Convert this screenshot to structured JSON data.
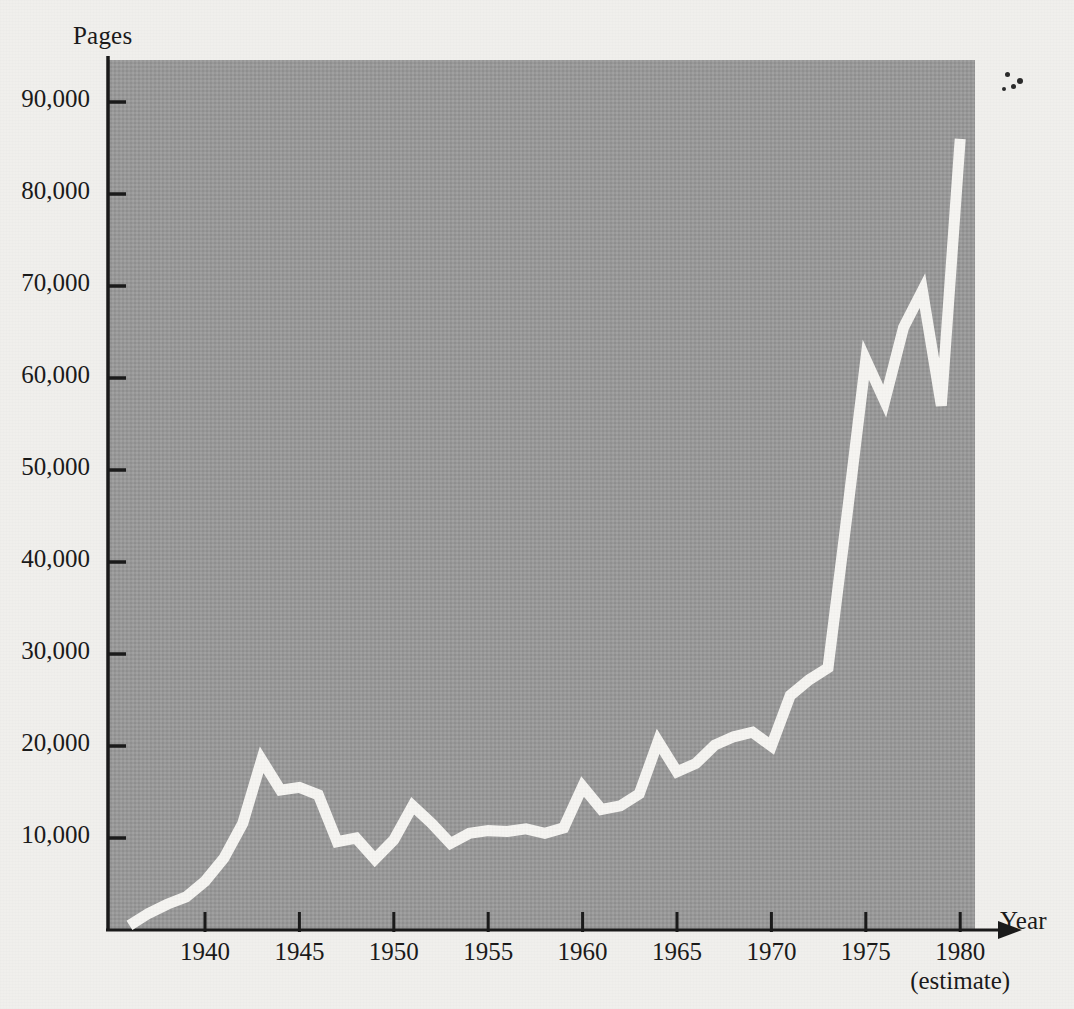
{
  "figure": {
    "y_axis_title": "Pages",
    "x_axis_title": "Year",
    "x_axis_subnote": "(estimate)",
    "plot_fill_color": "#9a9a9a",
    "line_color": "#f7f6f3",
    "axis_color": "#1a1a1a",
    "background_color": "#f2f1ee"
  },
  "y_ticks": [
    {
      "label": "90,000",
      "value": 90000
    },
    {
      "label": "80,000",
      "value": 80000
    },
    {
      "label": "70,000",
      "value": 70000
    },
    {
      "label": "60,000",
      "value": 60000
    },
    {
      "label": "50,000",
      "value": 50000
    },
    {
      "label": "40,000",
      "value": 40000
    },
    {
      "label": "30,000",
      "value": 30000
    },
    {
      "label": "20,000",
      "value": 20000
    },
    {
      "label": "10,000",
      "value": 10000
    }
  ],
  "x_ticks": [
    {
      "label": "1940",
      "value": 1940
    },
    {
      "label": "1945",
      "value": 1945
    },
    {
      "label": "1950",
      "value": 1950
    },
    {
      "label": "1955",
      "value": 1955
    },
    {
      "label": "1960",
      "value": 1960
    },
    {
      "label": "1965",
      "value": 1965
    },
    {
      "label": "1970",
      "value": 1970
    },
    {
      "label": "1975",
      "value": 1975
    },
    {
      "label": "1980",
      "value": 1980
    }
  ],
  "chart_data": {
    "type": "line",
    "title": "",
    "subtitle": "",
    "xlabel": "Year",
    "ylabel": "Pages",
    "xlim": [
      1935.5,
      1980.5
    ],
    "ylim": [
      0,
      97000
    ],
    "grid": false,
    "legend": "none",
    "annotations": [
      "(estimate)"
    ],
    "x": [
      1936,
      1937,
      1938,
      1939,
      1940,
      1941,
      1942,
      1943,
      1944,
      1945,
      1946,
      1947,
      1948,
      1949,
      1950,
      1951,
      1952,
      1953,
      1954,
      1955,
      1956,
      1957,
      1958,
      1959,
      1960,
      1961,
      1962,
      1963,
      1964,
      1965,
      1966,
      1967,
      1968,
      1969,
      1970,
      1971,
      1972,
      1973,
      1974,
      1975,
      1976,
      1977,
      1978,
      1979,
      1980
    ],
    "series": [
      {
        "name": "Pages in the Federal Register",
        "values": [
          500,
          1800,
          2800,
          3600,
          5300,
          7800,
          11600,
          18500,
          15200,
          15500,
          14700,
          9600,
          10000,
          7700,
          9800,
          13500,
          11600,
          9400,
          10500,
          10800,
          10700,
          11000,
          10500,
          11100,
          15600,
          13100,
          13500,
          14800,
          20500,
          17200,
          18100,
          20100,
          21000,
          21500,
          20000,
          25500,
          27200,
          28500,
          45000,
          62000,
          57500,
          65500,
          69500,
          57000,
          86000
        ]
      }
    ]
  },
  "artifacts": {
    "specks": [
      {
        "x": 1005,
        "y": 72,
        "r": 2.5
      },
      {
        "x": 1017,
        "y": 78,
        "r": 3.0
      },
      {
        "x": 1011,
        "y": 84,
        "r": 2.5
      },
      {
        "x": 1002,
        "y": 87,
        "r": 2.0
      }
    ]
  }
}
